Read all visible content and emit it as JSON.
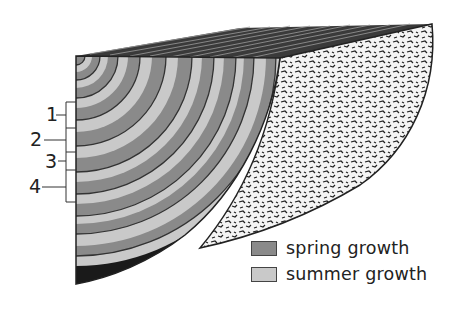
{
  "diagram": {
    "colors": {
      "spring": "#8a8a8a",
      "summer": "#c9c9c9",
      "bark": "#1a1a1a",
      "ring_line": "#333333",
      "outline": "#222222"
    },
    "ring_labels": [
      {
        "label": "1",
        "x": 52,
        "y": 121
      },
      {
        "label": "2",
        "x": 30,
        "y": 146
      },
      {
        "label": "3",
        "x": 45,
        "y": 165
      },
      {
        "label": "4",
        "x": 27,
        "y": 193
      }
    ]
  },
  "legend": {
    "items": [
      {
        "label": "spring growth",
        "swatch": "spring"
      },
      {
        "label": "summer growth",
        "swatch": "summer"
      }
    ]
  }
}
